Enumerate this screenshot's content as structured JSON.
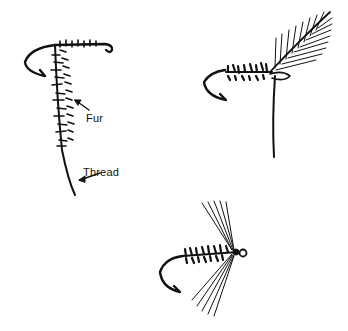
{
  "figure": {
    "panels": [
      {
        "id": "step-1",
        "labels": [
          {
            "text": "Fur",
            "x": 86,
            "y": 112
          },
          {
            "text": "Thread",
            "x": 83,
            "y": 166
          }
        ]
      },
      {
        "id": "step-2",
        "labels": []
      },
      {
        "id": "step-3",
        "labels": []
      }
    ],
    "ink_color": "#111111",
    "background": "#ffffff"
  }
}
